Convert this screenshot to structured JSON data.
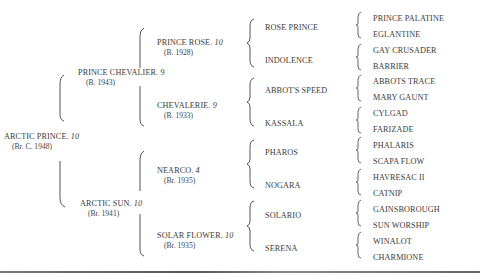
{
  "pedigree": {
    "subject": {
      "name": "ARCTIC PRINCE.",
      "rating": "10",
      "born": "(Br. C. 1948)"
    },
    "sire": {
      "name": "PRINCE CHEVALIER.",
      "rating": "9",
      "born": "(B. 1943)"
    },
    "dam": {
      "name": "ARCTIC SUN.",
      "rating": "10",
      "born": "(Br. 1941)"
    },
    "grandparents": [
      {
        "name": "PRINCE ROSE.",
        "rating": "10",
        "born": "(B. 1928)"
      },
      {
        "name": "CHEVALERIE.",
        "rating": "9",
        "born": "(B. 1933)"
      },
      {
        "name": "NEARCO.",
        "rating": "4",
        "born": "(Br. 1935)"
      },
      {
        "name": "SOLAR FLOWER.",
        "rating": "10",
        "born": "(Br. 1935)"
      }
    ],
    "great_grandparents": [
      "ROSE PRINCE",
      "INDOLENCE",
      "ABBOT'S SPEED",
      "KASSALA",
      "PHAROS",
      "NOGARA",
      "SOLARIO",
      "SERENA"
    ],
    "great_great_grandparents": [
      "PRINCE PALATINE",
      "EGLANTINE",
      "GAY CRUSADER",
      "BARRIER",
      "ABBOTS TRACE",
      "MARY GAUNT",
      "CYLGAD",
      "FARIZADE",
      "PHALARIS",
      "SCAPA FLOW",
      "HAVRESAC II",
      "CATNIP",
      "GAINSBOROUGH",
      "SUN WORSHIP",
      "WINALOT",
      "CHARMIONE"
    ]
  }
}
